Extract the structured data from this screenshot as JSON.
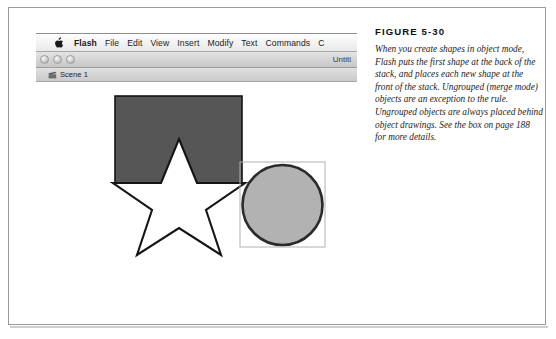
{
  "figure": {
    "number": "FIGURE 5-30",
    "caption": "When you create shapes in object mode, Flash puts the first shape at the back of the stack, and places each new shape at the front of the stack. Ungrouped (merge mode) objects are an exception to the rule. Ungrouped objects are always placed behind object drawings. See the box on page 188 for more details."
  },
  "app": {
    "menu_bar": {
      "apple_icon": "apple-icon",
      "items": [
        {
          "label": "Flash",
          "bold": true
        },
        {
          "label": "File",
          "bold": false
        },
        {
          "label": "Edit",
          "bold": false
        },
        {
          "label": "View",
          "bold": false
        },
        {
          "label": "Insert",
          "bold": false
        },
        {
          "label": "Modify",
          "bold": false
        },
        {
          "label": "Text",
          "bold": false
        },
        {
          "label": "Commands",
          "bold": false
        },
        {
          "label": "C",
          "bold": false
        }
      ]
    },
    "window": {
      "title": "Untitl",
      "traffic_lights": [
        "close-button",
        "minimize-button",
        "zoom-button"
      ],
      "scene": {
        "icon": "scene-clapperboard-icon",
        "label": "Scene 1"
      }
    },
    "stage": {
      "shapes": [
        {
          "name": "square-shape",
          "type": "rect",
          "x": 106,
          "y": 122,
          "width": 128,
          "height": 88,
          "fill": "#565656",
          "stroke": "#151515",
          "stroke_width": 1.5
        },
        {
          "name": "star-shape",
          "type": "star",
          "cx": 168,
          "cy": 225,
          "outer_radius": 84,
          "inner_radius": 34,
          "points": 5,
          "fill": "#ffffff",
          "stroke": "#151515",
          "stroke_width": 2
        },
        {
          "name": "circle-shape",
          "type": "circle",
          "cx": 292,
          "cy": 251,
          "radius": 41,
          "fill": "#b2b2b2",
          "stroke": "#2a2a2a",
          "stroke_width": 2.5,
          "selection_box": {
            "name": "circle-selection-box",
            "x": 250,
            "y": 209,
            "width": 85,
            "height": 85,
            "stroke": "#aaaaaa"
          }
        }
      ]
    }
  },
  "colors": {
    "frame_border": "#9a9a9a",
    "square_fill": "#565656",
    "circle_fill": "#b2b2b2",
    "outline": "#151515"
  }
}
